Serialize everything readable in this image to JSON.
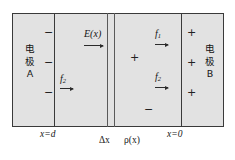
{
  "figure": {
    "background_color": "#ffffff",
    "panel_fill": "#e2e2e2",
    "line_color": "#3a3a3a"
  },
  "electrodes": {
    "left": {
      "name": "electrode-a",
      "line1": "电",
      "line2": "极",
      "line3": "A",
      "charge_signs": [
        "−",
        "−",
        "−"
      ],
      "polarity": "negative"
    },
    "right": {
      "name": "electrode-b",
      "line1": "电",
      "line2": "极",
      "line3": "B",
      "charge_signs": [
        "+",
        "+",
        "+"
      ],
      "polarity": "positive"
    }
  },
  "field": {
    "label": "E(x)",
    "direction": "right"
  },
  "forces": [
    {
      "id": "f2-left",
      "base": "f",
      "sub": "2",
      "direction": "right"
    },
    {
      "id": "f1-right",
      "base": "f",
      "sub": "1",
      "direction": "right"
    },
    {
      "id": "f2-right",
      "base": "f",
      "sub": "2",
      "direction": "right"
    }
  ],
  "bulk_charges": [
    {
      "id": "plus-mid",
      "symbol": "+"
    },
    {
      "id": "minus-mid",
      "symbol": "−"
    }
  ],
  "axis_labels": {
    "x_d": "x=d",
    "delta_x": "Δx",
    "rho": "ρ(x)",
    "x_0": "x=0"
  }
}
